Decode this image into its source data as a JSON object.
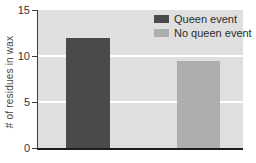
{
  "chart_data": {
    "type": "bar",
    "categories": [
      "Queen event",
      "No queen event"
    ],
    "series": [
      {
        "name": "Queen event",
        "value": 12,
        "color": "#4a4a4c"
      },
      {
        "name": "No queen event",
        "value": 9.5,
        "color": "#aeaeae"
      }
    ],
    "title": "",
    "xlabel": "",
    "ylabel": "# of residues in wax",
    "ylim": [
      0,
      15
    ],
    "yticks": [
      0,
      5,
      10,
      15
    ],
    "gridlines": [
      5,
      10
    ],
    "grid": true,
    "legend_position": "top-right",
    "colors": {
      "plot_background": "#dfdfdf",
      "gridline": "#ffffff",
      "axis": "#3c3c3c",
      "tick_text": "#333333",
      "legend_text": "#2b2b2b"
    }
  }
}
